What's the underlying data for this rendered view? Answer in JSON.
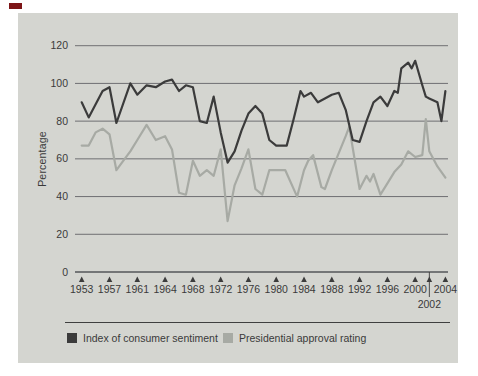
{
  "figure": {
    "corner_mark_color": "#7d1517",
    "panel_bg": "#d4d5d0",
    "text_color": "#3a3a3a",
    "gridline_color": "#55565a",
    "axis_color": "#3c3c3c"
  },
  "chart_data": {
    "type": "line",
    "title": "",
    "ylabel": "Percentage",
    "ylim": [
      0,
      120
    ],
    "yticks": [
      0,
      20,
      40,
      60,
      80,
      100,
      120
    ],
    "xticks": [
      1953,
      1957,
      1961,
      1964,
      1968,
      1972,
      1976,
      1980,
      1984,
      1988,
      1992,
      1996,
      2000,
      2002,
      2004
    ],
    "xtick_below_axis": 2002,
    "grid": "horizontal",
    "legend_position": "bottom",
    "series": [
      {
        "key": "consumer-sentiment",
        "name": "Index of consumer sentiment",
        "color": "#3b3b3b",
        "points": [
          [
            1953,
            90
          ],
          [
            1954,
            82
          ],
          [
            1956,
            96
          ],
          [
            1957,
            98
          ],
          [
            1958,
            79
          ],
          [
            1960,
            100
          ],
          [
            1961,
            94
          ],
          [
            1962,
            99
          ],
          [
            1963,
            98
          ],
          [
            1964,
            101
          ],
          [
            1965,
            102
          ],
          [
            1966,
            96
          ],
          [
            1967,
            99
          ],
          [
            1968,
            98
          ],
          [
            1969,
            80
          ],
          [
            1970,
            79
          ],
          [
            1971,
            93
          ],
          [
            1972,
            74
          ],
          [
            1973,
            58
          ],
          [
            1974,
            64
          ],
          [
            1975,
            75
          ],
          [
            1976,
            84
          ],
          [
            1977,
            88
          ],
          [
            1978,
            84
          ],
          [
            1979,
            70
          ],
          [
            1980,
            67
          ],
          [
            1981.5,
            67
          ],
          [
            1982.5,
            81
          ],
          [
            1983.5,
            96
          ],
          [
            1984,
            93
          ],
          [
            1985,
            95
          ],
          [
            1986,
            90
          ],
          [
            1987,
            92
          ],
          [
            1988,
            94
          ],
          [
            1989,
            95
          ],
          [
            1990,
            86
          ],
          [
            1991,
            70
          ],
          [
            1992,
            69
          ],
          [
            1993,
            80
          ],
          [
            1994,
            90
          ],
          [
            1995,
            93
          ],
          [
            1996,
            88
          ],
          [
            1997,
            96
          ],
          [
            1997.5,
            95
          ],
          [
            1998,
            108
          ],
          [
            1999,
            111
          ],
          [
            1999.5,
            108
          ],
          [
            2000,
            112
          ],
          [
            2001,
            99
          ],
          [
            2001.5,
            93
          ],
          [
            2002,
            92
          ],
          [
            2003,
            90
          ],
          [
            2003.5,
            80
          ],
          [
            2004,
            96
          ]
        ]
      },
      {
        "key": "approval-rating",
        "name": "Presidential approval rating",
        "color": "#a7aaa4",
        "points": [
          [
            1953,
            67
          ],
          [
            1954,
            67
          ],
          [
            1955,
            74
          ],
          [
            1956,
            76
          ],
          [
            1957,
            73
          ],
          [
            1958,
            54
          ],
          [
            1959,
            59
          ],
          [
            1960,
            64
          ],
          [
            1961,
            70
          ],
          [
            1962,
            78
          ],
          [
            1963,
            70
          ],
          [
            1964,
            72
          ],
          [
            1965,
            65
          ],
          [
            1966,
            42
          ],
          [
            1967,
            41
          ],
          [
            1968,
            59
          ],
          [
            1969,
            51
          ],
          [
            1970,
            54
          ],
          [
            1971,
            51
          ],
          [
            1972,
            65
          ],
          [
            1973,
            27
          ],
          [
            1974,
            46
          ],
          [
            1975,
            55
          ],
          [
            1976,
            65
          ],
          [
            1977,
            44
          ],
          [
            1978,
            41
          ],
          [
            1979,
            54
          ],
          [
            1980,
            54
          ],
          [
            1981.3,
            54
          ],
          [
            1983,
            40
          ],
          [
            1984,
            54
          ],
          [
            1984.6,
            59
          ],
          [
            1985.3,
            62
          ],
          [
            1986.5,
            45
          ],
          [
            1987,
            44
          ],
          [
            1988,
            54
          ],
          [
            1990,
            72
          ],
          [
            1990.5,
            77
          ],
          [
            1992,
            44
          ],
          [
            1993,
            51
          ],
          [
            1993.5,
            48
          ],
          [
            1994,
            52
          ],
          [
            1995,
            41
          ],
          [
            1996,
            47
          ],
          [
            1997,
            53
          ],
          [
            1998,
            57
          ],
          [
            1999,
            64
          ],
          [
            2000,
            61
          ],
          [
            2001,
            62
          ],
          [
            2001.5,
            81
          ],
          [
            2002,
            64
          ],
          [
            2003,
            56
          ],
          [
            2004,
            50
          ]
        ]
      }
    ]
  }
}
